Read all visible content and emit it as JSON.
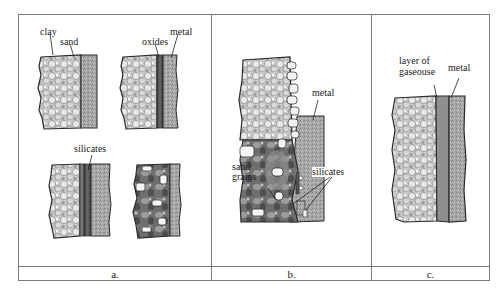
{
  "figure": {
    "panels": [
      {
        "id": "a",
        "caption": "a.",
        "labels": {
          "clay": "clay",
          "sand": "sand",
          "oxides": "oxides",
          "metal": "metal",
          "silicates": "silicates"
        }
      },
      {
        "id": "b",
        "caption": "b.",
        "labels": {
          "metal": "metal",
          "sand_line1": "sand",
          "sand_line2": "grains",
          "silicates": "silicates"
        }
      },
      {
        "id": "c",
        "caption": "c.",
        "labels": {
          "layer_line1": "layer of",
          "layer_line2": "gaseouse",
          "metal": "metal"
        }
      }
    ]
  },
  "colors": {
    "frame": "#7a7a7a",
    "mold": "#b8b8b8",
    "metal": "#9a9a9a",
    "oxide": "#555555",
    "outline": "#2a2a2a"
  }
}
